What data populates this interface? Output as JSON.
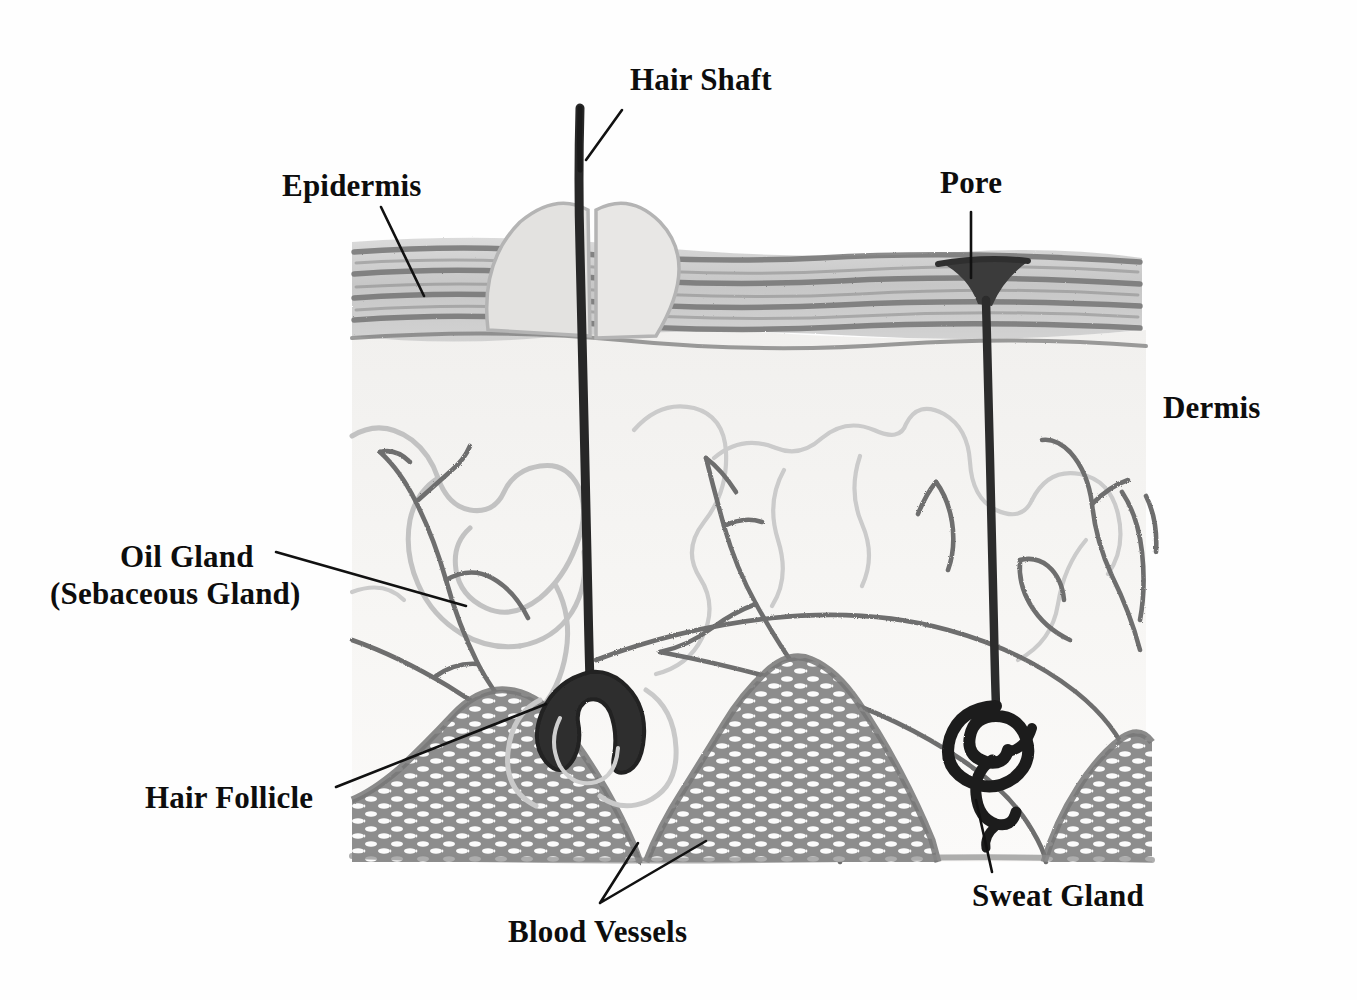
{
  "diagram": {
    "style": "pencil sketch, grayscale",
    "background_color": "#fefefe",
    "ink_color": "#0d0d0d"
  },
  "labels": [
    {
      "id": "hair-shaft",
      "text": "Hair Shaft",
      "x": 630,
      "y": 62,
      "leader": "diagonal-down-left"
    },
    {
      "id": "epidermis",
      "text": "Epidermis",
      "x": 282,
      "y": 168,
      "leader": "diagonal-down-right"
    },
    {
      "id": "pore",
      "text": "Pore",
      "x": 940,
      "y": 165,
      "leader": "vertical-down"
    },
    {
      "id": "dermis",
      "text": "Dermis",
      "x": 1163,
      "y": 390,
      "leader": "none"
    },
    {
      "id": "oil-gland-1",
      "text": "Oil Gland",
      "x": 120,
      "y": 538,
      "leader": "diagonal-down-right"
    },
    {
      "id": "oil-gland-2",
      "text": "(Sebaceous Gland)",
      "x": 50,
      "y": 575,
      "leader": "none"
    },
    {
      "id": "hair-follicle",
      "text": "Hair Follicle",
      "x": 145,
      "y": 780,
      "leader": "diagonal-up-right"
    },
    {
      "id": "blood-vessels",
      "text": "Blood Vessels",
      "x": 508,
      "y": 914,
      "leader": "v-split-up"
    },
    {
      "id": "sweat-gland",
      "text": "Sweat Gland",
      "x": 972,
      "y": 878,
      "leader": "vertical-up"
    }
  ],
  "layers": [
    {
      "name": "Epidermis",
      "tone": "#b9b9b9",
      "band_top": 240,
      "band_bottom": 350
    },
    {
      "name": "Dermis",
      "tone": "#f2f1ef",
      "band_top": 350,
      "band_bottom": 790
    },
    {
      "name": "Subcutaneous fat",
      "tone": "#9b9b9b",
      "band_top": 660,
      "band_bottom": 860
    }
  ],
  "structures": [
    {
      "name": "hair-shaft",
      "color": "#2a2a2a",
      "description": "dark vertical shaft from y=105 to follicle bulb"
    },
    {
      "name": "hair-follicle",
      "color": "#333333",
      "description": "dark bulb at base of hair root"
    },
    {
      "name": "sebaceous-gland",
      "color": "#bdbdbd",
      "description": "light lobed blob left of follicle"
    },
    {
      "name": "sweat-duct",
      "color": "#2f2f2f",
      "description": "dark duct from pore down to coiled gland"
    },
    {
      "name": "sweat-gland",
      "color": "#1f1f1f",
      "description": "dark coiled spiral tube"
    },
    {
      "name": "pore",
      "color": "#3a3a3a",
      "description": "dark funnel opening in epidermis"
    },
    {
      "name": "blood-vessels",
      "color": "#6e6e6e",
      "description": "branching gray vessel network in dermis"
    },
    {
      "name": "collagen",
      "color": "#cfcfcf",
      "description": "light wavy dermal contour lines"
    }
  ],
  "palette": {
    "ink": "#0d0d0d",
    "dark": "#2a2a2a",
    "mid": "#6e6e6e",
    "light": "#c3c3c3",
    "fat_fill": "#8f8f8f",
    "dermis_fill": "#f4f3f1",
    "paper": "#fefefe"
  }
}
